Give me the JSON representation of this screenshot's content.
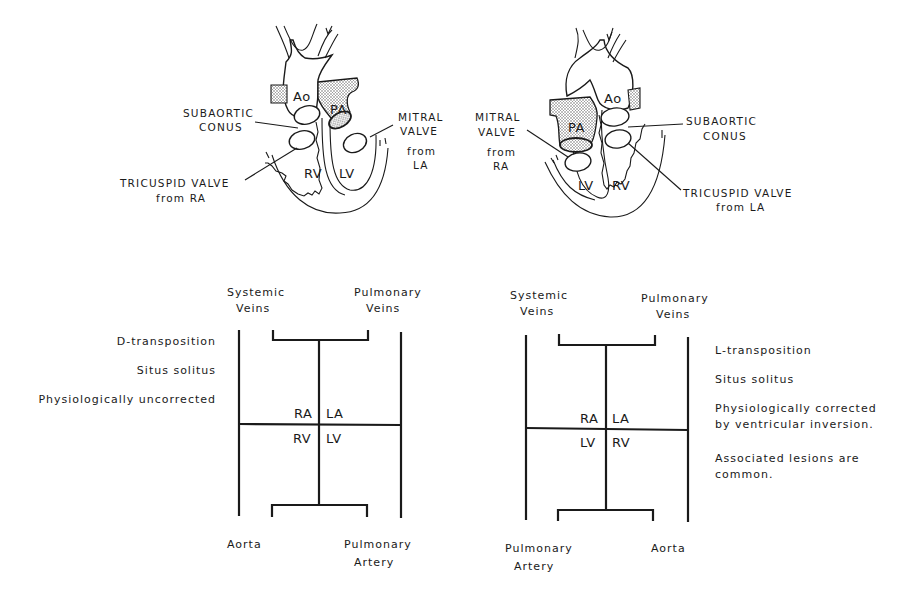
{
  "left_heart": {
    "labels": {
      "ao": "Ao",
      "pa": "PA",
      "rv": "RV",
      "lv": "LV",
      "subaortic_1": "SUBAORTIC",
      "subaortic_2": "CONUS",
      "mitral_1": "MITRAL",
      "mitral_2": "VALVE",
      "mitral_3": "from",
      "mitral_4": "LA",
      "tricuspid_1": "TRICUSPID VALVE",
      "tricuspid_2": "from RA"
    }
  },
  "right_heart": {
    "labels": {
      "ao": "Ao",
      "pa": "PA",
      "rv": "RV",
      "lv": "LV",
      "subaortic_1": "SUBAORTIC",
      "subaortic_2": "CONUS",
      "mitral_1": "MITRAL",
      "mitral_2": "VALVE",
      "mitral_3": "from",
      "mitral_4": "RA",
      "tricuspid_1": "TRICUSPID VALVE",
      "tricuspid_2": "from LA"
    }
  },
  "left_schematic": {
    "top_left_1": "Systemic",
    "top_left_2": "Veins",
    "top_right_1": "Pulmonary",
    "top_right_2": "Veins",
    "ra": "RA",
    "la": "LA",
    "rv": "RV",
    "lv": "LV",
    "bottom_left": "Aorta",
    "bottom_right_1": "Pulmonary",
    "bottom_right_2": "Artery",
    "notes": [
      "D-transposition",
      "Situs solitus",
      "Physiologically uncorrected"
    ]
  },
  "right_schematic": {
    "top_left_1": "Systemic",
    "top_left_2": "Veins",
    "top_right_1": "Pulmonary",
    "top_right_2": "Veins",
    "ra": "RA",
    "la": "LA",
    "lv": "LV",
    "rv": "RV",
    "bottom_left_1": "Pulmonary",
    "bottom_left_2": "Artery",
    "bottom_right": "Aorta",
    "notes": [
      "L-transposition",
      "Situs solitus",
      "Physiologically corrected",
      "by ventricular inversion.",
      "Associated lesions are",
      "common."
    ]
  }
}
